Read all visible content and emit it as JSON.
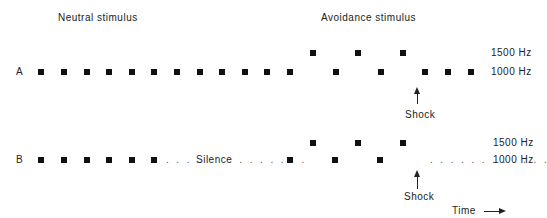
{
  "headers": {
    "neutral": "Neutral   stimulus",
    "avoidance": "Avoidance   stimulus"
  },
  "rows": {
    "A": {
      "label": "A",
      "low_x": [
        41,
        64,
        87,
        109,
        132,
        154,
        177,
        200,
        222,
        245,
        267,
        290,
        336,
        381,
        425,
        448,
        471
      ],
      "high_x": [
        313,
        358,
        403
      ],
      "shock_label": "Shock"
    },
    "B": {
      "label": "B",
      "low_x": [
        41,
        64,
        87,
        109,
        132,
        154,
        290,
        335,
        380
      ],
      "high_x": [
        313,
        358,
        403
      ],
      "silence_label": "Silence",
      "dots_left": ". . . .",
      "dots_mid": ". . . . . . . .",
      "dots_right": ". . . . . . . . . . . .",
      "shock_label": "Shock"
    }
  },
  "frequencies": {
    "high": "1500  Hz",
    "low": "1000  Hz"
  },
  "time_label": "Time"
}
